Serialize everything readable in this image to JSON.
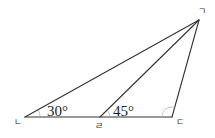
{
  "diagram": {
    "type": "geometry-triangle",
    "vertices": {
      "A": {
        "label": "ㄱ",
        "x": 199,
        "y": 20
      },
      "B": {
        "label": "ㄴ",
        "x": 25,
        "y": 117
      },
      "C": {
        "label": "ㄷ",
        "x": 172,
        "y": 117
      },
      "D": {
        "label": "ㄹ",
        "x": 100,
        "y": 117
      }
    },
    "segments": [
      [
        "ㄱ",
        "ㄴ"
      ],
      [
        "ㄱ",
        "ㄹ"
      ],
      [
        "ㄱ",
        "ㄷ"
      ],
      [
        "ㄴ",
        "ㄷ"
      ]
    ],
    "angles": [
      {
        "vertex": "ㄴ",
        "label": "30°"
      },
      {
        "vertex": "ㄹ",
        "label": "45°"
      },
      {
        "vertex": "ㄷ",
        "label": ""
      }
    ]
  }
}
